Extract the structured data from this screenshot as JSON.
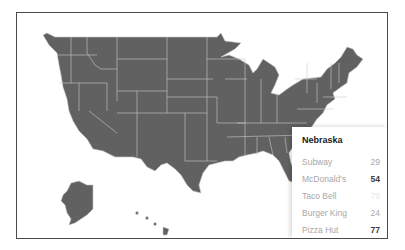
{
  "map": {
    "region": "United States",
    "fill_color": "#616161",
    "border_color": "#c9c9c9"
  },
  "tooltip": {
    "title": "Nebraska",
    "rows": [
      {
        "name": "Subway",
        "value": "29",
        "style": "normal"
      },
      {
        "name": "McDonald's",
        "value": "54",
        "style": "bold"
      },
      {
        "name": "Taco Bell",
        "value": "79",
        "style": "faint"
      },
      {
        "name": "Burger King",
        "value": "24",
        "style": "normal"
      },
      {
        "name": "Pizza Hut",
        "value": "77",
        "style": "bold"
      }
    ]
  }
}
